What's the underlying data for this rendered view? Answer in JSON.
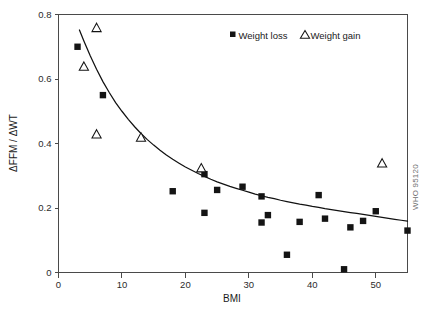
{
  "figure": {
    "watermark": "WHO 95120",
    "background_color": "#ffffff",
    "marker_color": "#141414",
    "curve_color": "#111111",
    "axis_color": "#4a4a4a"
  },
  "chart_data": {
    "type": "scatter",
    "title": "",
    "xlabel": "BMI",
    "ylabel": "ΔFFM / ΔWT",
    "xlim": [
      0,
      55
    ],
    "ylim": [
      0,
      0.8
    ],
    "xticks": [
      0,
      10,
      20,
      30,
      40,
      50
    ],
    "xticklabels": [
      "0",
      "10",
      "20",
      "30",
      "40",
      "50"
    ],
    "yticks": [
      0,
      0.2,
      0.4,
      0.6,
      0.8
    ],
    "yticklabels": [
      "0",
      "0.2",
      "0.4",
      "0.6",
      "0.8"
    ],
    "grid": false,
    "legend_position": "top-right",
    "series": [
      {
        "name": "Weight loss",
        "marker": "filled-square",
        "points": [
          [
            3.0,
            0.7
          ],
          [
            7.0,
            0.55
          ],
          [
            18.0,
            0.252
          ],
          [
            23.0,
            0.185
          ],
          [
            23.0,
            0.305
          ],
          [
            25.0,
            0.256
          ],
          [
            29.0,
            0.266
          ],
          [
            32.0,
            0.155
          ],
          [
            32.0,
            0.236
          ],
          [
            33.0,
            0.178
          ],
          [
            36.0,
            0.055
          ],
          [
            38.0,
            0.157
          ],
          [
            41.0,
            0.24
          ],
          [
            42.0,
            0.167
          ],
          [
            45.0,
            0.01
          ],
          [
            46.0,
            0.14
          ],
          [
            48.0,
            0.16
          ],
          [
            50.0,
            0.19
          ],
          [
            55.0,
            0.13
          ]
        ]
      },
      {
        "name": "Weight gain",
        "marker": "open-triangle",
        "points": [
          [
            4.0,
            0.64
          ],
          [
            6.0,
            0.76
          ],
          [
            6.0,
            0.43
          ],
          [
            13.0,
            0.42
          ],
          [
            22.5,
            0.325
          ],
          [
            51.0,
            0.34
          ]
        ]
      }
    ],
    "fit_curve": {
      "name": "fitted decay curve",
      "points": [
        [
          3.3,
          0.752
        ],
        [
          4.0,
          0.718
        ],
        [
          5.0,
          0.672
        ],
        [
          6.0,
          0.63
        ],
        [
          7.0,
          0.592
        ],
        [
          8.0,
          0.558
        ],
        [
          9.0,
          0.527
        ],
        [
          10.0,
          0.5
        ],
        [
          11.0,
          0.475
        ],
        [
          12.0,
          0.452
        ],
        [
          13.0,
          0.431
        ],
        [
          14.0,
          0.412
        ],
        [
          15.0,
          0.395
        ],
        [
          16.0,
          0.379
        ],
        [
          17.0,
          0.364
        ],
        [
          18.0,
          0.351
        ],
        [
          19.0,
          0.339
        ],
        [
          20.0,
          0.327
        ],
        [
          21.0,
          0.317
        ],
        [
          22.0,
          0.307
        ],
        [
          23.0,
          0.298
        ],
        [
          24.0,
          0.289
        ],
        [
          25.0,
          0.281
        ],
        [
          26.0,
          0.274
        ],
        [
          27.0,
          0.267
        ],
        [
          28.0,
          0.261
        ],
        [
          29.0,
          0.255
        ],
        [
          30.0,
          0.249
        ],
        [
          31.0,
          0.243
        ],
        [
          32.0,
          0.238
        ],
        [
          33.0,
          0.233
        ],
        [
          34.0,
          0.229
        ],
        [
          35.0,
          0.224
        ],
        [
          36.0,
          0.22
        ],
        [
          37.0,
          0.216
        ],
        [
          38.0,
          0.212
        ],
        [
          39.0,
          0.209
        ],
        [
          40.0,
          0.205
        ],
        [
          41.0,
          0.202
        ],
        [
          42.0,
          0.198
        ],
        [
          43.0,
          0.195
        ],
        [
          44.0,
          0.192
        ],
        [
          45.0,
          0.189
        ],
        [
          46.0,
          0.186
        ],
        [
          47.0,
          0.183
        ],
        [
          48.0,
          0.18
        ],
        [
          49.0,
          0.177
        ],
        [
          50.0,
          0.174
        ],
        [
          51.0,
          0.171
        ],
        [
          52.0,
          0.168
        ],
        [
          53.0,
          0.165
        ],
        [
          54.0,
          0.162
        ],
        [
          55.0,
          0.159
        ]
      ]
    },
    "legend": [
      {
        "label": "Weight loss",
        "marker": "filled-square"
      },
      {
        "label": "Weight gain",
        "marker": "open-triangle"
      }
    ]
  }
}
